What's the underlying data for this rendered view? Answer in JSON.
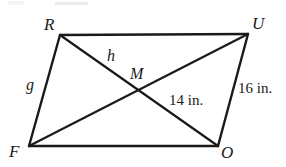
{
  "figure": {
    "kind": "geometry-diagram",
    "shape": "parallelogram",
    "name": "FROU",
    "background_color": "#ffffff",
    "stroke_color": "#1a1a1a",
    "stroke_width": 2,
    "vertices": [
      {
        "id": "R",
        "label": "R",
        "x": 60,
        "y": 35,
        "label_x": 44,
        "label_y": 16
      },
      {
        "id": "U",
        "label": "U",
        "x": 248,
        "y": 34,
        "label_x": 252,
        "label_y": 15
      },
      {
        "id": "O",
        "label": "O",
        "x": 218,
        "y": 146,
        "label_x": 221,
        "label_y": 144
      },
      {
        "id": "F",
        "label": "F",
        "x": 29,
        "y": 146,
        "label_x": 9,
        "label_y": 143
      }
    ],
    "intersection": {
      "id": "M",
      "label": "M",
      "x": 139,
      "y": 91,
      "label_x": 130,
      "label_y": 66
    },
    "sides": [
      {
        "from": "R",
        "to": "U"
      },
      {
        "from": "U",
        "to": "O"
      },
      {
        "from": "O",
        "to": "F"
      },
      {
        "from": "F",
        "to": "R"
      }
    ],
    "diagonals": [
      {
        "from": "R",
        "to": "O"
      },
      {
        "from": "F",
        "to": "U"
      }
    ],
    "labels": [
      {
        "id": "h",
        "text": "h",
        "x": 107,
        "y": 48,
        "style": "italic",
        "describes": "segment RM"
      },
      {
        "id": "g",
        "text": "g",
        "x": 26,
        "y": 77,
        "style": "italic",
        "describes": "side FR"
      }
    ],
    "measurements": [
      {
        "id": "seg-14",
        "text": "14 in.",
        "x": 169,
        "y": 93,
        "describes": "segment MO"
      },
      {
        "id": "seg-16",
        "text": "16 in.",
        "x": 238,
        "y": 81,
        "describes": "side UO"
      }
    ]
  }
}
